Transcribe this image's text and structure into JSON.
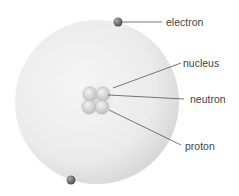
{
  "diagram": {
    "type": "atom model",
    "labels": {
      "electron": "electron",
      "nucleus": "nucleus",
      "neutron": "neutron",
      "proton": "proton"
    },
    "colors": {
      "atom_fill": "#e6e6e6",
      "electron": "#6e6e6e",
      "nucleon": "#d8d8d8",
      "leader_line": "#555555"
    }
  }
}
